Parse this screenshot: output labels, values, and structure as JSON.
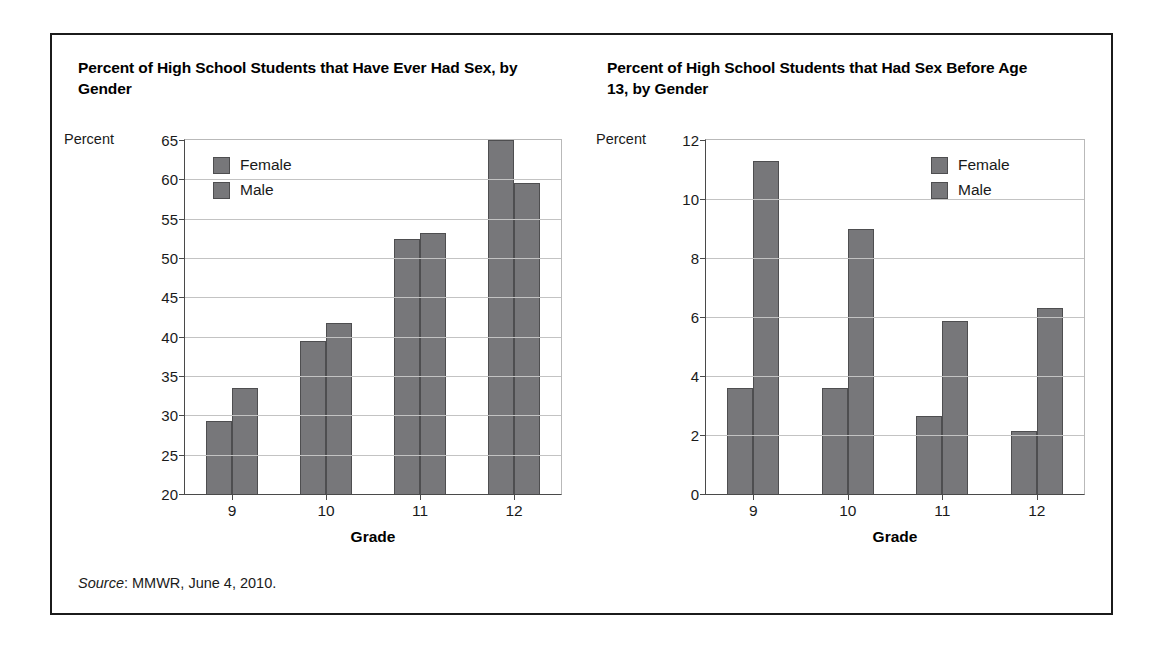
{
  "source_note": {
    "label": "Source",
    "text": ": MMWR, June 4, 2010."
  },
  "chart_data": [
    {
      "type": "bar",
      "title": "Percent of High School Students that Have Ever Had Sex, by Gender",
      "xlabel": "Grade",
      "ylabel": "Percent",
      "categories": [
        "9",
        "10",
        "11",
        "12"
      ],
      "yticks": [
        20,
        25,
        30,
        35,
        40,
        45,
        50,
        55,
        60,
        65
      ],
      "ylim": [
        20,
        65
      ],
      "grid": true,
      "legend_position": "upper-left",
      "series": [
        {
          "name": "Female",
          "color": "#77777a",
          "values": [
            29.3,
            39.5,
            52.4,
            65.0
          ]
        },
        {
          "name": "Male",
          "color": "#77777a",
          "values": [
            33.5,
            41.8,
            53.2,
            59.5
          ]
        }
      ]
    },
    {
      "type": "bar",
      "title": "Percent of High School Students that Had Sex Before Age 13, by Gender",
      "xlabel": "Grade",
      "ylabel": "Percent",
      "categories": [
        "9",
        "10",
        "11",
        "12"
      ],
      "yticks": [
        0,
        2,
        4,
        6,
        8,
        10,
        12
      ],
      "ylim": [
        0,
        12
      ],
      "grid": true,
      "legend_position": "upper-right",
      "series": [
        {
          "name": "Female",
          "color": "#77777a",
          "values": [
            3.6,
            3.6,
            2.65,
            2.15
          ]
        },
        {
          "name": "Male",
          "color": "#77777a",
          "values": [
            11.3,
            9.0,
            5.85,
            6.3
          ]
        }
      ]
    }
  ]
}
